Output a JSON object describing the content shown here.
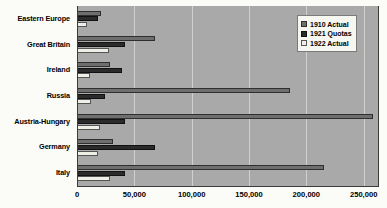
{
  "chart_data": {
    "type": "bar",
    "orientation": "horizontal",
    "title": "",
    "subtitle": "",
    "xlabel": "",
    "ylabel": "",
    "xlim": [
      0,
      262500
    ],
    "grid": true,
    "legend_position": "top-right",
    "xticks": [
      "0",
      "50,000",
      "100,000",
      "150,000",
      "200,000",
      "250,000"
    ],
    "xtick_values": [
      0,
      50000,
      100000,
      150000,
      200000,
      250000
    ],
    "categories": [
      "Eastern Europe",
      "Great Britain",
      "Ireland",
      "Russia",
      "Austria-Hungary",
      "Germany",
      "Italy"
    ],
    "series": [
      {
        "name": "1910 Actual",
        "color": "#6e6e6e",
        "values": [
          21000,
          68000,
          29000,
          186000,
          258000,
          31000,
          215000
        ]
      },
      {
        "name": "1921 Quotas",
        "color": "#2b2b2b",
        "values": [
          18000,
          42000,
          39000,
          24000,
          42000,
          68000,
          42000
        ]
      },
      {
        "name": "1922 Actual",
        "color": "#efefe8",
        "values": [
          9000,
          28000,
          11000,
          12000,
          20000,
          18000,
          29000
        ]
      }
    ]
  },
  "legend": {
    "items": [
      {
        "label": "1910 Actual"
      },
      {
        "label": "1921 Quotas"
      },
      {
        "label": "1922 Actual"
      }
    ]
  },
  "colors": {
    "plot_background": "#a9a9a9",
    "page_background": "#fbfbf8",
    "gridline": "#d0d0cc",
    "axis": "#3a3a3a",
    "series_1910": "#6e6e6e",
    "series_1921": "#2b2b2b",
    "series_1922": "#efefe8"
  }
}
